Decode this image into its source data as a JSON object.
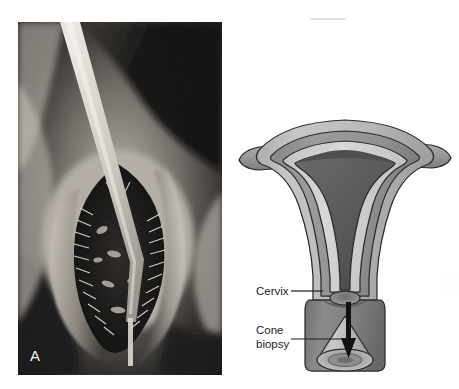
{
  "figure": {
    "panels": [
      {
        "letter": "A",
        "kind": "clinical-photograph",
        "subject": "cervix viewed through speculum with lesion",
        "palette": {
          "background": "#1a1a1a",
          "tissue_light": "#d8d4ce",
          "tissue_mid": "#8e8880",
          "lesion_dark": "#141414",
          "instrument": "#efeae2",
          "letter_color": "#f2f2f2"
        }
      },
      {
        "letter": "B",
        "kind": "anatomical-diagram",
        "subject": "uterus coronal section showing cone biopsy of cervix",
        "labels": [
          {
            "id": "cervix",
            "text": "Cervix"
          },
          {
            "id": "cone-biopsy",
            "text": "Cone\nbiopsy"
          }
        ],
        "palette": {
          "outline": "#2b2b2b",
          "serosa": "#b9b9b9",
          "myometrium": "#8f8f8f",
          "endometrium_lining": "#cfcfcf",
          "cavity_dark": "#5c5c5c",
          "cavity_deep": "#3e3e3e",
          "cervix_block": "#7d7d7d",
          "cone_light": "#bdbdbd",
          "arrow": "#111111",
          "label_color": "#1d1d1d"
        }
      }
    ],
    "edge_artifact": {
      "text": "·\n·\n·\n·\n·\n·\n·\n·\n·\n·\n·\n·"
    }
  }
}
